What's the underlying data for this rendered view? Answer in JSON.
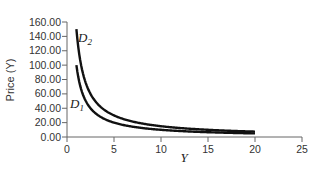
{
  "chart_data": {
    "type": "line",
    "title": "",
    "xlabel": "Y",
    "ylabel": "Price (Y)",
    "xlim": [
      0,
      25
    ],
    "ylim": [
      0,
      160
    ],
    "x_ticks": [
      "0",
      "5",
      "10",
      "15",
      "20",
      "25"
    ],
    "y_ticks": [
      "0.00",
      "20.00",
      "40.00",
      "60.00",
      "80.00",
      "100.00",
      "120.00",
      "140.00",
      "160.00"
    ],
    "grid": false,
    "legend": "inline labels",
    "series": [
      {
        "name": "D1",
        "label_main": "D",
        "label_sub": "1",
        "x": [
          1,
          1.5,
          2,
          3,
          4,
          5,
          6,
          8,
          10,
          12,
          15,
          20
        ],
        "values": [
          100,
          66.67,
          50,
          33.33,
          25,
          20,
          16.67,
          12.5,
          10,
          8.33,
          6.67,
          5
        ]
      },
      {
        "name": "D2",
        "label_main": "D",
        "label_sub": "2",
        "x": [
          1,
          1.5,
          2,
          3,
          4,
          5,
          6,
          8,
          10,
          12,
          15,
          20
        ],
        "values": [
          150,
          100,
          75,
          50,
          37.5,
          30,
          25,
          18.75,
          15,
          12.5,
          10,
          7.5
        ]
      }
    ]
  }
}
